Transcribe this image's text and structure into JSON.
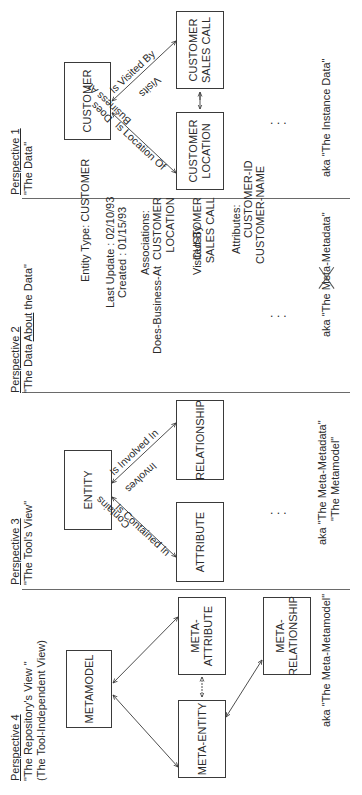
{
  "perspectives": [
    {
      "number_label": "Perspective 1",
      "subtitle": "\"The Data\"",
      "boxes": {
        "customer": "CUSTOMER",
        "sales_call_line1": "CUSTOMER",
        "sales_call_line2": "SALES CALL",
        "location_line1": "CUSTOMER",
        "location_line2": "LOCATION"
      },
      "relationship_labels": {
        "is_visited_by": "Is Visited By",
        "visits": "Visits",
        "does_business_at_line1": "Does",
        "does_business_at_line2": "Business At",
        "is_location_of": "Is Location Of"
      },
      "ellipsis": ". . .",
      "aka": "aka \"The Instance Data\""
    },
    {
      "number_label": "Perspective 2",
      "subtitle_prefix": "\"The Data ",
      "subtitle_underlined": "About",
      "subtitle_suffix": " the Data\"",
      "entity_type": "Entity Type: CUSTOMER",
      "last_update": "Last Update : 02/10/93",
      "created": "Created : 01/15/93",
      "associations_label": "Associations:",
      "associations": [
        {
          "name": "Does-Business-At",
          "target_line1": "CUSTOMER",
          "target_line2": "LOCATION"
        },
        {
          "name": "Visited-By",
          "target_line1": "CUSTOMER",
          "target_line2": "SALES CALL"
        }
      ],
      "attributes_label": "Attributes:",
      "attributes": [
        "CUSTOMER-ID",
        "CUSTOMER-NAME"
      ],
      "ellipsis": ". . .",
      "aka_prefix": "aka \"The ",
      "aka_struck": "Meta",
      "aka_suffix": "-Metadata\""
    },
    {
      "number_label": "Perspective 3",
      "subtitle": "\"The Tool's View\"",
      "boxes": {
        "entity": "ENTITY",
        "relationship": "RELATIONSHIP",
        "attribute": "ATTRIBUTE"
      },
      "relationship_labels": {
        "is_involved_in": "Is Involved In",
        "involves": "Involves",
        "contains": "Contains",
        "is_contained_in": "Is Contained In"
      },
      "ellipsis": ". . .",
      "aka_line1": "aka \"The Meta-Metadata\"",
      "aka_line2": "\"The Metamodel\""
    },
    {
      "number_label": "Perspective 4",
      "subtitle": "\"The Repository's View \"",
      "subtitle2": "(The Tool-Independent View)",
      "boxes": {
        "metamodel": "METAMODEL",
        "meta_attribute_line1": "META-",
        "meta_attribute_line2": "ATTRIBUTE",
        "meta_entity": "META-ENTITY",
        "meta_relationship_line1": "META-",
        "meta_relationship_line2": "RELATIONSHIP"
      },
      "aka": "aka \"The Meta-Metamodel\""
    }
  ],
  "colors": {
    "line": "#3a3a3a",
    "separator": "#6a6a6a",
    "text": "#2a2a2a",
    "background": "#ffffff"
  }
}
